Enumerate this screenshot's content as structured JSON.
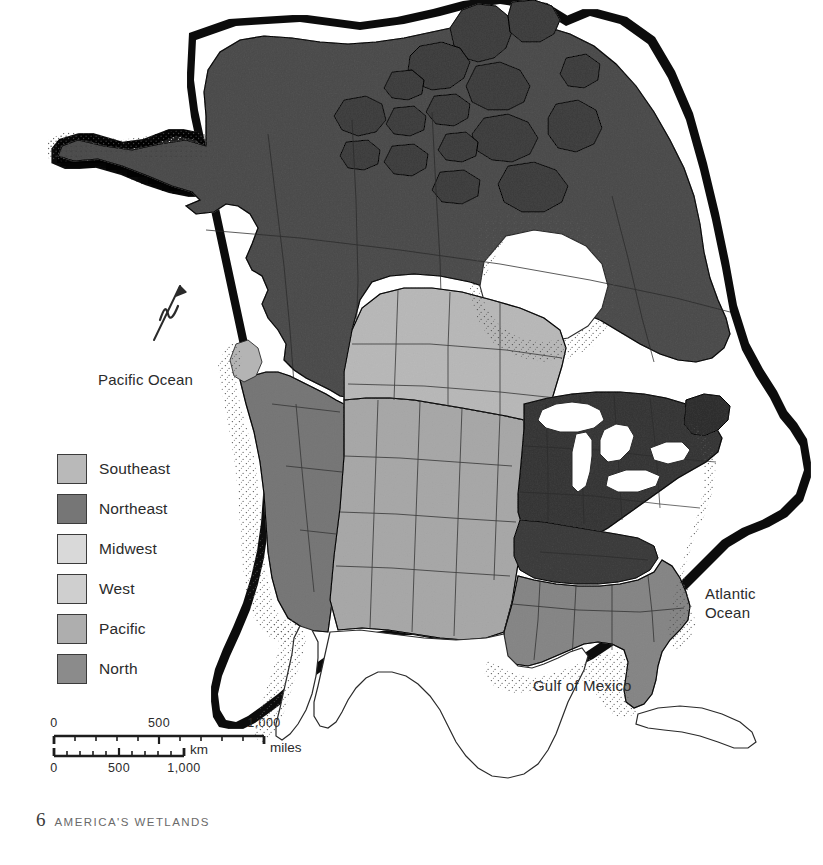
{
  "page": {
    "footer_page_number": "6",
    "footer_book_title": "AMERICA'S WETLANDS",
    "background_color": "#ffffff"
  },
  "map": {
    "title_alt": "Regional wetlands map of North America",
    "labels": {
      "pacific_ocean": "Pacific Ocean",
      "atlantic_ocean": "Atlantic\nOcean",
      "gulf_of_mexico": "Gulf of Mexico"
    },
    "north_arrow": {
      "name": "north-arrow",
      "glyph": "N"
    },
    "line_color": "#2a2a2a",
    "water_color": "#ffffff",
    "stipple_color": "#4a4a4a",
    "uncolored_land_color": "#ffffff"
  },
  "legend": {
    "items": [
      {
        "label": "Southeast",
        "color": "#b9b9b9"
      },
      {
        "label": "Northeast",
        "color": "#767676"
      },
      {
        "label": "Midwest",
        "color": "#d9d9d9"
      },
      {
        "label": "West",
        "color": "#cfcfcf"
      },
      {
        "label": "Pacific",
        "color": "#aeaeae"
      },
      {
        "label": "North",
        "color": "#8b8b8b"
      }
    ]
  },
  "scale_bar": {
    "miles": {
      "unit": "miles",
      "ticks": [
        "0",
        "500",
        "1,000"
      ],
      "minor_divisions": 10
    },
    "km": {
      "unit": "km",
      "ticks": [
        "0",
        "500",
        "1,000"
      ],
      "minor_divisions": 10
    }
  }
}
